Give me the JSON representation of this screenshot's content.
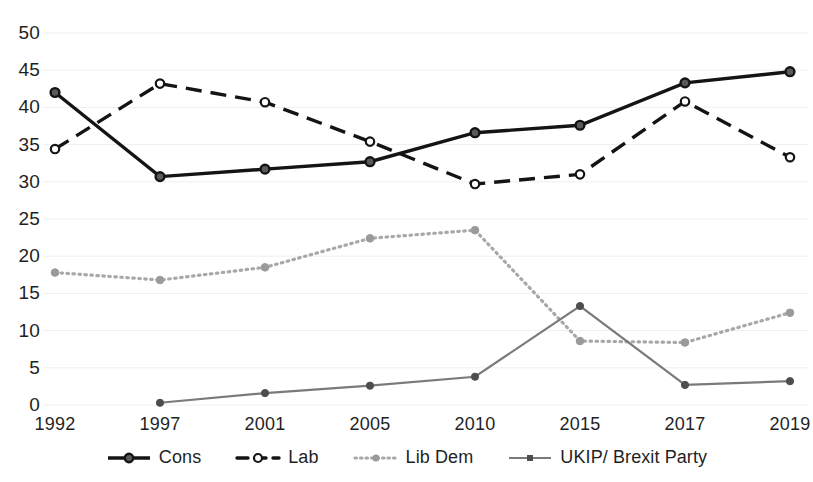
{
  "chart_data": {
    "type": "line",
    "title": "",
    "xlabel": "",
    "ylabel": "",
    "categories": [
      "1992",
      "1997",
      "2001",
      "2005",
      "2010",
      "2015",
      "2017",
      "2019"
    ],
    "ylim": [
      0,
      50
    ],
    "yticks": [
      0,
      5,
      10,
      15,
      20,
      25,
      30,
      35,
      40,
      45,
      50
    ],
    "grid": true,
    "grid_axis": "y",
    "legend_position": "bottom",
    "series": [
      {
        "name": "Cons",
        "values": [
          42.0,
          30.7,
          31.7,
          32.7,
          36.6,
          37.6,
          43.3,
          44.8
        ],
        "color": "#141414",
        "line_style": "solid",
        "marker": "filled-circle"
      },
      {
        "name": "Lab",
        "values": [
          34.4,
          43.2,
          40.7,
          35.4,
          29.7,
          31.0,
          40.8,
          33.3
        ],
        "color": "#141414",
        "line_style": "dashed",
        "marker": "open-circle"
      },
      {
        "name": "Lib Dem",
        "values": [
          17.8,
          16.8,
          18.5,
          22.4,
          23.5,
          8.6,
          8.4,
          12.4
        ],
        "color": "#a8a8a8",
        "line_style": "dotted",
        "marker": "filled-circle"
      },
      {
        "name": "UKIP/ Brexit Party",
        "values": [
          null,
          0.3,
          1.6,
          2.6,
          3.8,
          13.3,
          2.7,
          3.2
        ],
        "color": "#7a7a7a",
        "line_style": "solid",
        "marker": "filled-circle"
      }
    ]
  },
  "axis": {
    "y_tick_labels": [
      "50",
      "45",
      "40",
      "35",
      "30",
      "25",
      "20",
      "15",
      "10",
      "5",
      "0"
    ],
    "x_tick_labels": [
      "1992",
      "1997",
      "2001",
      "2005",
      "2010",
      "2015",
      "2017",
      "2019"
    ]
  },
  "legend": {
    "items": [
      {
        "label": "Cons",
        "icon": "solid-line-filled-circle-marker"
      },
      {
        "label": "Lab",
        "icon": "dashed-line-open-circle-marker"
      },
      {
        "label": "Lib Dem",
        "icon": "dotted-line-filled-circle-marker"
      },
      {
        "label": "UKIP/ Brexit Party",
        "icon": "solid-line-filled-square-marker"
      }
    ]
  },
  "colors": {
    "grid": "#efefef",
    "cons": "#141414",
    "lab": "#141414",
    "libdem": "#a8a8a8",
    "ukip": "#7a7a7a",
    "text": "#1f1f1f",
    "background": "#ffffff"
  }
}
